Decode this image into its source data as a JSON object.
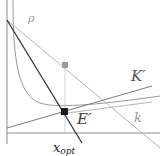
{
  "diagram": {
    "labels": {
      "rho": "ρ",
      "k_prime": "K′",
      "k": "k",
      "e_prime": "E′",
      "x": "x",
      "opt": "opt"
    },
    "colors": {
      "axis": "#8c8c8c",
      "light_line": "#b4b4b4",
      "mid_line": "#7a7a7a",
      "dark_line": "#333333",
      "optimum_point": "#1a1a1a",
      "marker_point": "#9a9a9a"
    },
    "elements": [
      "vertical axis",
      "horizontal axis",
      "decreasing convex curve",
      "line rho (light)",
      "line K' (rising, medium gray)",
      "line k (rising, light)",
      "steep dark line through optimum",
      "optimum point E' at x_opt",
      "gray marker point on vertical through x_opt"
    ]
  }
}
